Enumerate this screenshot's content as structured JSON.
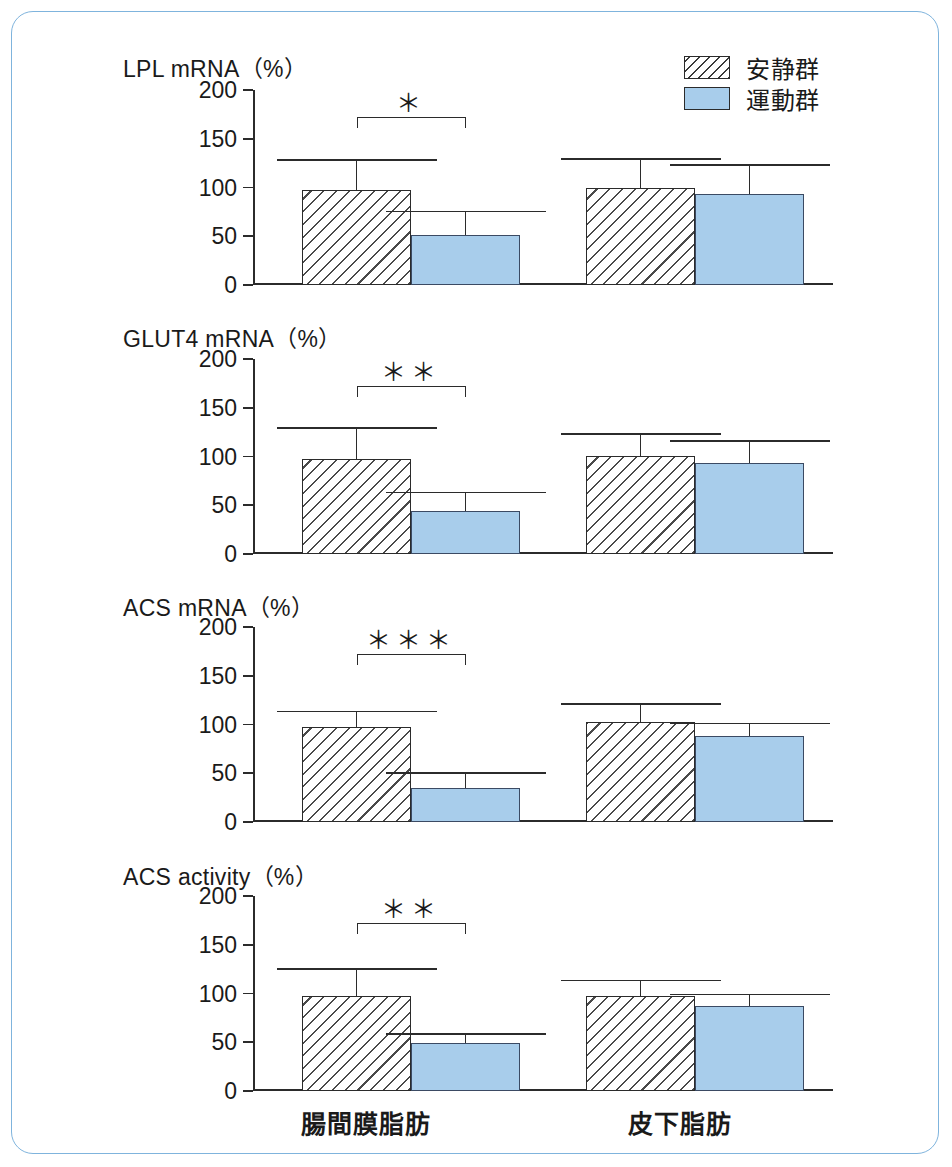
{
  "legend": {
    "items": [
      {
        "label": "安静群",
        "pattern": "hatch",
        "color": "#ffffff"
      },
      {
        "label": "運動群",
        "pattern": "solid",
        "color": "#a8cdeb"
      }
    ]
  },
  "axis": {
    "ticks": [
      "0",
      "50",
      "100",
      "150",
      "200"
    ],
    "tick_values": [
      0,
      50,
      100,
      150,
      200
    ],
    "ylim": [
      0,
      200
    ]
  },
  "categories": [
    "腸間膜脂肪",
    "皮下脂肪"
  ],
  "colors": {
    "frame": "#7fb4dd",
    "exercise_fill": "#a8cdeb",
    "ink": "#2b2b2b"
  },
  "panels": [
    {
      "title": "LPL mRNA（%）",
      "significance": "＊"
    },
    {
      "title": "GLUT4 mRNA（%）",
      "significance": "＊＊"
    },
    {
      "title": "ACS mRNA（%）",
      "significance": "＊＊＊"
    },
    {
      "title": "ACS activity（%）",
      "significance": "＊＊"
    }
  ],
  "chart_data": [
    {
      "type": "bar",
      "title": "LPL mRNA（%）",
      "ylabel": "LPL mRNA (%)",
      "xlabel": "",
      "ylim": [
        0,
        200
      ],
      "yticks": [
        0,
        50,
        100,
        150,
        200
      ],
      "grid": false,
      "legend_position": "top-right",
      "categories": [
        "腸間膜脂肪",
        "皮下脂肪"
      ],
      "series": [
        {
          "name": "安静群",
          "values": [
            97,
            99
          ],
          "errors": [
            32,
            31
          ]
        },
        {
          "name": "運動群",
          "values": [
            51,
            93
          ],
          "errors": [
            25,
            31
          ]
        }
      ],
      "annotations": [
        {
          "text": "＊",
          "between": [
            "安静群",
            "運動群"
          ],
          "category": "腸間膜脂肪"
        }
      ]
    },
    {
      "type": "bar",
      "title": "GLUT4 mRNA（%）",
      "ylabel": "GLUT4 mRNA (%)",
      "xlabel": "",
      "ylim": [
        0,
        200
      ],
      "yticks": [
        0,
        50,
        100,
        150,
        200
      ],
      "grid": false,
      "legend_position": "top-right",
      "categories": [
        "腸間膜脂肪",
        "皮下脂肪"
      ],
      "series": [
        {
          "name": "安静群",
          "values": [
            97,
            101
          ],
          "errors": [
            33,
            23
          ]
        },
        {
          "name": "運動群",
          "values": [
            44,
            93
          ],
          "errors": [
            20,
            24
          ]
        }
      ],
      "annotations": [
        {
          "text": "＊＊",
          "between": [
            "安静群",
            "運動群"
          ],
          "category": "腸間膜脂肪"
        }
      ]
    },
    {
      "type": "bar",
      "title": "ACS mRNA（%）",
      "ylabel": "ACS mRNA (%)",
      "xlabel": "",
      "ylim": [
        0,
        200
      ],
      "yticks": [
        0,
        50,
        100,
        150,
        200
      ],
      "grid": false,
      "legend_position": "top-right",
      "categories": [
        "腸間膜脂肪",
        "皮下脂肪"
      ],
      "series": [
        {
          "name": "安静群",
          "values": [
            97,
            103
          ],
          "errors": [
            17,
            19
          ]
        },
        {
          "name": "運動群",
          "values": [
            35,
            88
          ],
          "errors": [
            16,
            14
          ]
        }
      ],
      "annotations": [
        {
          "text": "＊＊＊",
          "between": [
            "安静群",
            "運動群"
          ],
          "category": "腸間膜脂肪"
        }
      ]
    },
    {
      "type": "bar",
      "title": "ACS activity（%）",
      "ylabel": "ACS activity (%)",
      "xlabel": "",
      "ylim": [
        0,
        200
      ],
      "yticks": [
        0,
        50,
        100,
        150,
        200
      ],
      "grid": false,
      "legend_position": "top-right",
      "categories": [
        "腸間膜脂肪",
        "皮下脂肪"
      ],
      "series": [
        {
          "name": "安静群",
          "values": [
            97,
            97
          ],
          "errors": [
            29,
            17
          ]
        },
        {
          "name": "運動群",
          "values": [
            49,
            87
          ],
          "errors": [
            10,
            13
          ]
        }
      ],
      "annotations": [
        {
          "text": "＊＊",
          "between": [
            "安静群",
            "運動群"
          ],
          "category": "腸間膜脂肪"
        }
      ]
    }
  ]
}
